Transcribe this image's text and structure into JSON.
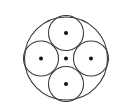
{
  "diagram": {
    "outer_circle": {
      "cx": 66,
      "cy": 58.5,
      "r": 41.5
    },
    "inner_circles": [
      {
        "position": "top",
        "cx": 66,
        "cy": 33,
        "r": 17.5
      },
      {
        "position": "right",
        "cx": 91,
        "cy": 58.5,
        "r": 17.5
      },
      {
        "position": "bottom",
        "cx": 66,
        "cy": 84,
        "r": 17.5
      },
      {
        "position": "left",
        "cx": 41,
        "cy": 58.5,
        "r": 17.5
      }
    ],
    "center_dots": [
      {
        "label": "outer-center",
        "cx": 66,
        "cy": 58.5
      },
      {
        "label": "top-center",
        "cx": 66,
        "cy": 33
      },
      {
        "label": "right-center",
        "cx": 91,
        "cy": 58.5
      },
      {
        "label": "bottom-center",
        "cx": 66,
        "cy": 84
      },
      {
        "label": "left-center",
        "cx": 41,
        "cy": 58.5
      }
    ],
    "dot_radius": 2,
    "colors": {
      "stroke": "#3a3a3a",
      "dot": "#111111",
      "background": "#ffffff"
    }
  }
}
